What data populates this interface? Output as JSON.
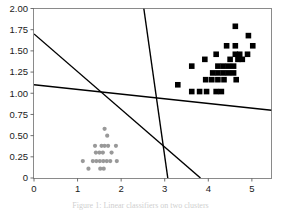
{
  "figure": {
    "caption": "Figure 1: Linear classifiers on two clusters"
  },
  "chart_data": {
    "type": "scatter",
    "title": "",
    "xlabel": "",
    "ylabel": "",
    "xlim": [
      0,
      5.45
    ],
    "ylim": [
      0,
      2.0
    ],
    "grid": false,
    "legend": null,
    "xticks": [
      "0",
      "1",
      "2",
      "3",
      "4",
      "5"
    ],
    "xtick_values": [
      0,
      1,
      2,
      3,
      4,
      5
    ],
    "yticks": [
      "0",
      "0.25",
      "0.50",
      "0.75",
      "1.00",
      "1.25",
      "1.50",
      "1.75",
      "2.00"
    ],
    "ytick_values": [
      0,
      0.25,
      0.5,
      0.75,
      1.0,
      1.25,
      1.5,
      1.75,
      2.0
    ],
    "series": [
      {
        "name": "cluster-gray",
        "marker": "circle",
        "color": "#999999",
        "size": 4.2,
        "points": [
          [
            1.62,
            0.58
          ],
          [
            1.68,
            0.5
          ],
          [
            1.4,
            0.38
          ],
          [
            1.55,
            0.38
          ],
          [
            1.62,
            0.38
          ],
          [
            1.7,
            0.38
          ],
          [
            1.88,
            0.38
          ],
          [
            1.42,
            0.3
          ],
          [
            1.5,
            0.3
          ],
          [
            1.58,
            0.3
          ],
          [
            1.78,
            0.3
          ],
          [
            1.12,
            0.2
          ],
          [
            1.35,
            0.2
          ],
          [
            1.43,
            0.2
          ],
          [
            1.51,
            0.2
          ],
          [
            1.59,
            0.2
          ],
          [
            1.67,
            0.2
          ],
          [
            1.75,
            0.2
          ],
          [
            1.9,
            0.2
          ],
          [
            1.25,
            0.11
          ],
          [
            1.52,
            0.11
          ],
          [
            1.6,
            0.11
          ]
        ]
      },
      {
        "name": "cluster-black",
        "marker": "square",
        "color": "#000000",
        "size": 5.6,
        "points": [
          [
            4.62,
            1.79
          ],
          [
            4.92,
            1.68
          ],
          [
            4.42,
            1.56
          ],
          [
            4.62,
            1.56
          ],
          [
            5.02,
            1.56
          ],
          [
            4.18,
            1.46
          ],
          [
            4.62,
            1.46
          ],
          [
            4.72,
            1.46
          ],
          [
            4.9,
            1.46
          ],
          [
            3.92,
            1.4
          ],
          [
            4.5,
            1.4
          ],
          [
            4.68,
            1.4
          ],
          [
            4.78,
            1.4
          ],
          [
            3.62,
            1.32
          ],
          [
            4.22,
            1.32
          ],
          [
            4.34,
            1.32
          ],
          [
            4.46,
            1.32
          ],
          [
            4.58,
            1.32
          ],
          [
            4.1,
            1.24
          ],
          [
            4.22,
            1.24
          ],
          [
            4.34,
            1.24
          ],
          [
            4.46,
            1.24
          ],
          [
            4.58,
            1.24
          ],
          [
            3.94,
            1.16
          ],
          [
            4.08,
            1.16
          ],
          [
            4.22,
            1.16
          ],
          [
            4.36,
            1.16
          ],
          [
            4.64,
            1.16
          ],
          [
            3.3,
            1.1
          ],
          [
            3.62,
            1.02
          ],
          [
            3.8,
            1.02
          ],
          [
            3.96,
            1.02
          ],
          [
            4.18,
            1.02
          ],
          [
            4.3,
            1.02
          ]
        ]
      }
    ],
    "lines": [
      {
        "name": "boundary-steep-diagonal",
        "color": "#000000",
        "width": 1.4,
        "p1": [
          2.52,
          2.0
        ],
        "p2": [
          3.07,
          0.0
        ]
      },
      {
        "name": "boundary-upper-left",
        "color": "#000000",
        "width": 1.4,
        "p1": [
          0.0,
          1.7
        ],
        "p2": [
          3.82,
          0.0
        ]
      },
      {
        "name": "boundary-shallow",
        "color": "#000000",
        "width": 1.4,
        "p1": [
          0.0,
          1.1
        ],
        "p2": [
          5.45,
          0.8
        ]
      }
    ]
  }
}
